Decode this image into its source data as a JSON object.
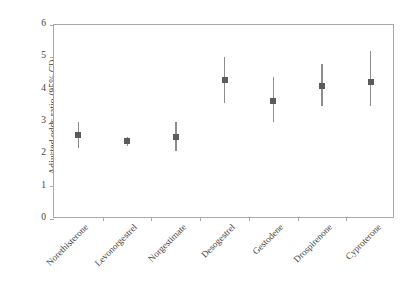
{
  "chart_data": {
    "type": "scatter",
    "title": "",
    "xlabel": "",
    "ylabel": "Adjusted odds ratio (95% CI)",
    "ylim": [
      0,
      6
    ],
    "yticks": [
      0,
      1,
      2,
      3,
      4,
      5,
      6
    ],
    "ytick_labels": [
      "0",
      "1",
      "2",
      "3",
      "4",
      "5",
      "6"
    ],
    "grid": false,
    "legend": "none",
    "error_bars": "95% confidence interval (vertical line)",
    "marker_style": "filled square",
    "categories": [
      "Norethisterone",
      "Levonorgestrel",
      "Norgestimate",
      "Desogestrel",
      "Gestodene",
      "Drospirenone",
      "Cyproterone"
    ],
    "values": [
      2.6,
      2.4,
      2.55,
      4.3,
      3.65,
      4.1,
      4.25
    ],
    "ci_lower": [
      2.2,
      2.25,
      2.1,
      3.6,
      3.0,
      3.5,
      3.5
    ],
    "ci_upper": [
      3.0,
      2.55,
      3.0,
      5.0,
      4.4,
      4.8,
      5.2
    ],
    "points": [
      {
        "category": "Norethisterone",
        "value": 2.6,
        "ci_lower": 2.2,
        "ci_upper": 3.0
      },
      {
        "category": "Levonorgestrel",
        "value": 2.4,
        "ci_lower": 2.25,
        "ci_upper": 2.55
      },
      {
        "category": "Norgestimate",
        "value": 2.55,
        "ci_lower": 2.1,
        "ci_upper": 3.0
      },
      {
        "category": "Desogestrel",
        "value": 4.3,
        "ci_lower": 3.6,
        "ci_upper": 5.0
      },
      {
        "category": "Gestodene",
        "value": 3.65,
        "ci_lower": 3.0,
        "ci_upper": 4.4
      },
      {
        "category": "Drospirenone",
        "value": 4.1,
        "ci_lower": 3.5,
        "ci_upper": 4.8
      },
      {
        "category": "Cyproterone",
        "value": 4.25,
        "ci_lower": 3.5,
        "ci_upper": 5.2
      }
    ]
  },
  "colors": {
    "marker": "#5b5b5b",
    "error_bar": "#8d8d8d",
    "axis": "#a9a9a9",
    "text": "#3f3f3f",
    "background": "#ffffff"
  }
}
